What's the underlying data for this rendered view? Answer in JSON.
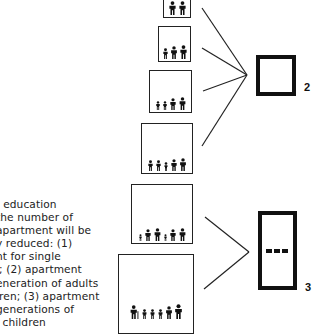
{
  "caption": {
    "lines": [
      ": education",
      " the number of",
      "apartment will be",
      "y reduced: (1)",
      "nt for single",
      "l; (2) apartment",
      "eneration of adults",
      "lren; (3) apartment",
      "generations of",
      "l children"
    ]
  },
  "households": [
    {
      "id": "household-1",
      "figures": [
        "adult",
        "adult"
      ]
    },
    {
      "id": "household-2",
      "figures": [
        "child",
        "adult",
        "adult"
      ]
    },
    {
      "id": "household-3",
      "figures": [
        "child",
        "child",
        "adult",
        "adult"
      ]
    },
    {
      "id": "household-4",
      "figures": [
        "child",
        "child",
        "toddler",
        "adult",
        "adult"
      ]
    },
    {
      "id": "household-5",
      "figures": [
        "toddler",
        "adult",
        "adult",
        "toddler",
        "adult",
        "adult"
      ]
    },
    {
      "id": "household-6",
      "figures": [
        "elder-with-cane",
        "child",
        "child",
        "child",
        "adult",
        "adult"
      ]
    }
  ],
  "apartments": [
    {
      "type": "2",
      "label": "2"
    },
    {
      "type": "3",
      "label": "3"
    }
  ],
  "colors": {
    "ink": "#111111",
    "paper": "#ffffff"
  }
}
